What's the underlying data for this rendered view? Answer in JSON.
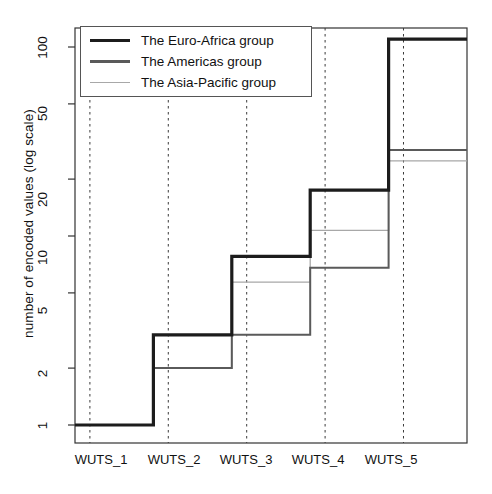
{
  "chart_data": {
    "type": "line",
    "subtype": "step",
    "title": "",
    "xlabel": "",
    "ylabel": "number of encoded values  (log scale)",
    "categories": [
      "WUTS_1",
      "WUTS_2",
      "WUTS_3",
      "WUTS_4",
      "WUTS_5"
    ],
    "yscale": "log",
    "ylim": [
      0.82,
      135
    ],
    "yticks": [
      1,
      2,
      5,
      10,
      20,
      50,
      100
    ],
    "ytick_labels": [
      "1",
      "2",
      "5",
      "10",
      "20",
      "50",
      "100"
    ],
    "grid": "vertical-dashed-at-category-boundaries",
    "legend_position": "top-left",
    "series": [
      {
        "name": "The Euro-Africa group",
        "values": [
          1,
          3,
          7.8,
          17.5,
          110
        ],
        "color": "#1c1c1c",
        "width": 3.2
      },
      {
        "name": "The Americas group",
        "values": [
          1,
          2,
          3,
          6.8,
          28.5
        ],
        "color": "#5a5a5a",
        "width": 2.0
      },
      {
        "name": "The Asia-Pacific group",
        "values": [
          1,
          2,
          5.7,
          10.7,
          25
        ],
        "color": "#a8a8a8",
        "width": 1.3
      }
    ]
  },
  "axis": {
    "y_title": "number of encoded values  (log scale)",
    "ytick_0": "1",
    "ytick_1": "2",
    "ytick_2": "5",
    "ytick_3": "10",
    "ytick_4": "20",
    "ytick_5": "50",
    "ytick_6": "100",
    "xtick_0": "WUTS_1",
    "xtick_1": "WUTS_2",
    "xtick_2": "WUTS_3",
    "xtick_3": "WUTS_4",
    "xtick_4": "WUTS_5"
  },
  "legend": {
    "entries": [
      {
        "label": "The Euro-Africa group"
      },
      {
        "label": "The Americas group"
      },
      {
        "label": "The Asia-Pacific group"
      }
    ]
  },
  "colors": {
    "axis": "#333333",
    "grid": "#3a3a3a",
    "background": "#ffffff",
    "series_1": "#1c1c1c",
    "series_2": "#5a5a5a",
    "series_3": "#a8a8a8"
  }
}
